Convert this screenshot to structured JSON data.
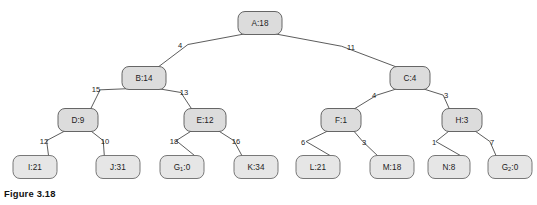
{
  "figure": {
    "caption": "Figure 3.18",
    "type": "game-tree",
    "node_fill": "#dcdcdc",
    "leaf_fill": "#e6e6e6",
    "stroke": "#575757",
    "background": "#ffffff"
  },
  "nodes": [
    {
      "id": "A",
      "label": "A:18",
      "name": "A",
      "value": "18",
      "level": 0,
      "x": 260,
      "y": 23,
      "w": 44,
      "h": 23,
      "leaf": false
    },
    {
      "id": "B",
      "label": "B:14",
      "name": "B",
      "value": "14",
      "level": 1,
      "x": 144,
      "y": 78,
      "w": 44,
      "h": 23,
      "leaf": false
    },
    {
      "id": "C",
      "label": "C:4",
      "name": "C",
      "value": "4",
      "level": 1,
      "x": 410,
      "y": 78,
      "w": 40,
      "h": 23,
      "leaf": false
    },
    {
      "id": "D",
      "label": "D:9",
      "name": "D",
      "value": "9",
      "level": 2,
      "x": 78,
      "y": 120,
      "w": 40,
      "h": 23,
      "leaf": false
    },
    {
      "id": "E",
      "label": "E:12",
      "name": "E",
      "value": "12",
      "level": 2,
      "x": 205,
      "y": 120,
      "w": 42,
      "h": 23,
      "leaf": false
    },
    {
      "id": "F",
      "label": "F:1",
      "name": "F",
      "value": "1",
      "level": 2,
      "x": 341,
      "y": 120,
      "w": 40,
      "h": 23,
      "leaf": false
    },
    {
      "id": "H",
      "label": "H:3",
      "name": "H",
      "value": "3",
      "level": 2,
      "x": 462,
      "y": 120,
      "w": 40,
      "h": 23,
      "leaf": false
    },
    {
      "id": "I",
      "label": "I:21",
      "name": "I",
      "value": "21",
      "level": 3,
      "x": 35,
      "y": 167,
      "w": 44,
      "h": 23,
      "leaf": true
    },
    {
      "id": "J",
      "label": "J:31",
      "name": "J",
      "value": "31",
      "level": 3,
      "x": 118,
      "y": 167,
      "w": 44,
      "h": 23,
      "leaf": true
    },
    {
      "id": "G1",
      "label": "G1:0",
      "name": "G",
      "sub": "1",
      "value": "0",
      "level": 3,
      "x": 182,
      "y": 167,
      "w": 44,
      "h": 23,
      "leaf": true
    },
    {
      "id": "K",
      "label": "K:34",
      "name": "K",
      "value": "34",
      "level": 3,
      "x": 256,
      "y": 167,
      "w": 44,
      "h": 23,
      "leaf": true
    },
    {
      "id": "L",
      "label": "L:21",
      "name": "L",
      "value": "21",
      "level": 3,
      "x": 318,
      "y": 167,
      "w": 44,
      "h": 23,
      "leaf": true
    },
    {
      "id": "M",
      "label": "M:18",
      "name": "M",
      "value": "18",
      "level": 3,
      "x": 392,
      "y": 167,
      "w": 44,
      "h": 23,
      "leaf": true
    },
    {
      "id": "N",
      "label": "N:8",
      "name": "N",
      "value": "8",
      "level": 3,
      "x": 449,
      "y": 167,
      "w": 42,
      "h": 23,
      "leaf": true
    },
    {
      "id": "G2",
      "label": "G2:0",
      "name": "G",
      "sub": "2",
      "value": "0",
      "level": 3,
      "x": 510,
      "y": 167,
      "w": 44,
      "h": 23,
      "leaf": true
    }
  ],
  "edges": [
    {
      "from": "A",
      "to": "B",
      "label": "4",
      "lx": 180,
      "ly": 46
    },
    {
      "from": "A",
      "to": "C",
      "label": "11",
      "lx": 351,
      "ly": 48
    },
    {
      "from": "B",
      "to": "D",
      "label": "15",
      "lx": 96,
      "ly": 90
    },
    {
      "from": "B",
      "to": "E",
      "label": "13",
      "lx": 184,
      "ly": 93
    },
    {
      "from": "C",
      "to": "F",
      "label": "4",
      "lx": 374,
      "ly": 96
    },
    {
      "from": "C",
      "to": "H",
      "label": "3",
      "lx": 446,
      "ly": 96
    },
    {
      "from": "D",
      "to": "I",
      "label": "12",
      "lx": 44,
      "ly": 142
    },
    {
      "from": "D",
      "to": "J",
      "label": "10",
      "lx": 105,
      "ly": 142
    },
    {
      "from": "E",
      "to": "G1",
      "label": "18",
      "lx": 174,
      "ly": 142
    },
    {
      "from": "E",
      "to": "K",
      "label": "16",
      "lx": 236,
      "ly": 142
    },
    {
      "from": "F",
      "to": "L",
      "label": "6",
      "lx": 303,
      "ly": 143
    },
    {
      "from": "F",
      "to": "M",
      "label": "3",
      "lx": 364,
      "ly": 143
    },
    {
      "from": "H",
      "to": "N",
      "label": "1",
      "lx": 434,
      "ly": 143
    },
    {
      "from": "H",
      "to": "G2",
      "label": "7",
      "lx": 492,
      "ly": 143
    }
  ]
}
